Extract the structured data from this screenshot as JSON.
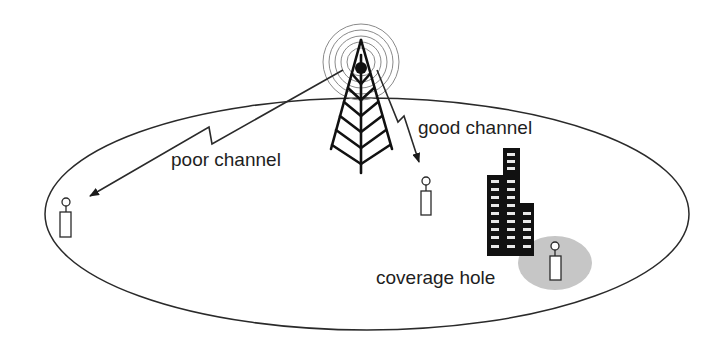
{
  "diagram": {
    "type": "cellular-coverage-illustration",
    "labels": {
      "poor_channel": "poor channel",
      "good_channel": "good channel",
      "coverage_hole": "coverage hole"
    },
    "elements": {
      "base_station": {
        "name": "cell tower",
        "icon": "radio-tower-icon",
        "signal_rings": 5
      },
      "cell_boundary": {
        "shape": "ellipse"
      },
      "mobile_users": [
        {
          "id": "user-far-left",
          "link": "poor channel"
        },
        {
          "id": "user-center",
          "link": "good channel"
        },
        {
          "id": "user-shadowed",
          "region": "coverage hole"
        }
      ],
      "obstacle": {
        "name": "building",
        "icon": "building-icon"
      }
    },
    "colors": {
      "line": "#2a2a2a",
      "building": "#111111",
      "window": "#e8e8e8",
      "coverage_hole": "#c6c6c6",
      "rings": "#8a8a8a",
      "background": "#ffffff"
    }
  }
}
